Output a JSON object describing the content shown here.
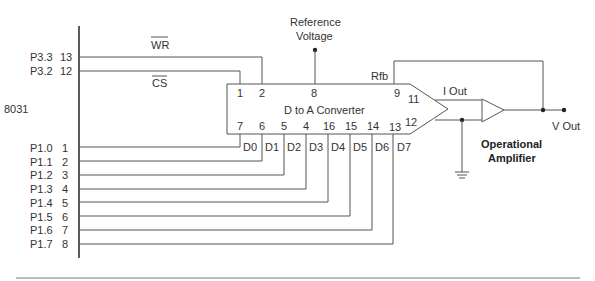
{
  "mcu": {
    "label": "8031",
    "control_pins": [
      {
        "port": "P3.3",
        "pin": "13",
        "signal": "WR"
      },
      {
        "port": "P3.2",
        "pin": "12",
        "signal": "CS"
      }
    ],
    "data_pins": [
      {
        "port": "P1.0",
        "pin": "1"
      },
      {
        "port": "P1.1",
        "pin": "2"
      },
      {
        "port": "P1.2",
        "pin": "3"
      },
      {
        "port": "P1.3",
        "pin": "4"
      },
      {
        "port": "P1.4",
        "pin": "5"
      },
      {
        "port": "P1.5",
        "pin": "6"
      },
      {
        "port": "P1.6",
        "pin": "7"
      },
      {
        "port": "P1.7",
        "pin": "8"
      }
    ]
  },
  "dac": {
    "label": "D to A Converter",
    "top_pins": [
      "1",
      "2",
      "8",
      "9"
    ],
    "bottom_pins": [
      "7",
      "6",
      "5",
      "4",
      "16",
      "15",
      "14",
      "13"
    ],
    "data_labels": [
      "D0",
      "D1",
      "D2",
      "D3",
      "D4",
      "D5",
      "D6",
      "D7"
    ],
    "out_pins": [
      "11",
      "12"
    ],
    "rfb_label": "Rfb"
  },
  "reference": {
    "line1": "Reference",
    "line2": "Voltage"
  },
  "iout_label": "I Out",
  "opamp": {
    "line1": "Operational",
    "line2": "Amplifier"
  },
  "vout_label": "V Out"
}
